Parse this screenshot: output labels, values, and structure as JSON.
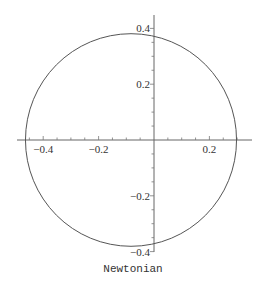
{
  "chart_data": {
    "type": "line",
    "title": "",
    "plot_label": "Newtonian",
    "xlabel": "",
    "ylabel": "",
    "xlim": [
      -0.49,
      0.35
    ],
    "ylim": [
      -0.405,
      0.45
    ],
    "grid": false,
    "legend": null,
    "x_ticks": [
      -0.4,
      -0.2,
      0.2
    ],
    "x_tick_labels": [
      "−0.4",
      "−0.2",
      "0.2"
    ],
    "y_ticks": [
      0.4,
      0.2,
      -0.2,
      -0.4
    ],
    "y_tick_labels": [
      "0.4",
      "0.2",
      "−0.2",
      "−0.4"
    ],
    "minor_tick_step": 0.05,
    "series": [
      {
        "name": "orbit",
        "shape": "circle",
        "center": [
          -0.083,
          0.0
        ],
        "radius": 0.381,
        "color": "#555555"
      }
    ],
    "key_points": {
      "leftmost_x": -0.464,
      "rightmost_x": 0.298,
      "top_y": 0.381,
      "bottom_y": -0.381,
      "y_axis_intercepts": [
        0.372,
        -0.372
      ]
    }
  },
  "layout": {
    "origin_px": [
      154,
      140
    ],
    "px_per_unit_x": 277,
    "px_per_unit_y": 279,
    "x_axis_px_range": [
      17,
      252
    ],
    "y_axis_px_range": [
      15,
      252
    ],
    "label_pos_px": [
      133,
      272
    ]
  }
}
